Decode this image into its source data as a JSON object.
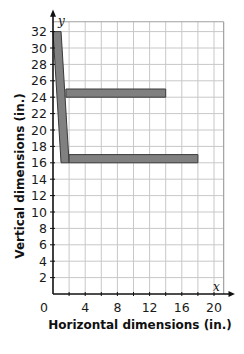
{
  "chart_data": {
    "type": "line",
    "title": "",
    "xlabel": "Horizontal dimensions (in.)",
    "ylabel": "Vertical dimensions (in.)",
    "x_axis_var": "x",
    "y_axis_var": "y",
    "xlim": [
      0,
      20
    ],
    "ylim": [
      0,
      32
    ],
    "xticks": [
      "0",
      "4",
      "8",
      "12",
      "16",
      "20"
    ],
    "yticks": [
      "2",
      "4",
      "6",
      "8",
      "10",
      "12",
      "14",
      "16",
      "18",
      "20",
      "22",
      "24",
      "26",
      "28",
      "30",
      "32"
    ],
    "grid": true,
    "grid_step": {
      "x": 2,
      "y": 2
    },
    "shape_color": "#808080",
    "shapes": [
      {
        "name": "vertical-bar",
        "points": [
          [
            0,
            32
          ],
          [
            1,
            32
          ],
          [
            2,
            16
          ],
          [
            1,
            16
          ]
        ]
      },
      {
        "name": "upper-horizontal-bar",
        "points": [
          [
            1.6,
            25
          ],
          [
            14,
            25
          ],
          [
            14,
            24
          ],
          [
            1.6,
            24
          ]
        ]
      },
      {
        "name": "lower-horizontal-bar",
        "points": [
          [
            2,
            17
          ],
          [
            18,
            17
          ],
          [
            18,
            16
          ],
          [
            2,
            16
          ]
        ]
      }
    ]
  }
}
